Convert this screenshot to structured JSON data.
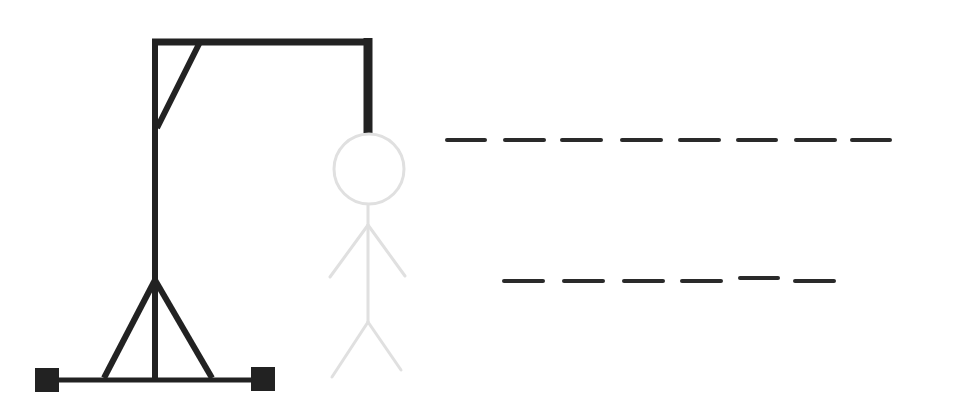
{
  "game": {
    "type": "hangman",
    "colors": {
      "gallows": "#222222",
      "figure_hidden": "#e0e0e0",
      "blank": "#2a2a2a",
      "background": "#ffffff"
    },
    "figure": {
      "parts": [
        "head",
        "body",
        "left-arm",
        "right-arm",
        "left-leg",
        "right-leg"
      ],
      "revealed_parts": 0
    },
    "words": [
      {
        "row": 1,
        "length": 8,
        "letters": [
          "",
          "",
          "",
          "",
          "",
          "",
          "",
          ""
        ]
      },
      {
        "row": 2,
        "length": 6,
        "letters": [
          "",
          "",
          "",
          "",
          "",
          ""
        ]
      }
    ]
  }
}
